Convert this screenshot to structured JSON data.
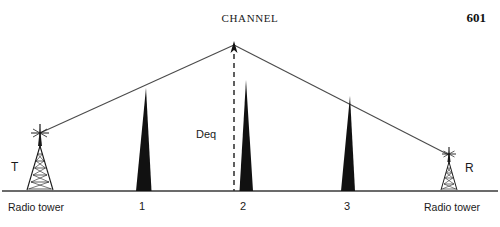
{
  "header": {
    "title": "CHANNEL",
    "page_number": "601"
  },
  "figure": {
    "baseline_label": "ground-line",
    "towers": [
      {
        "id": "transmit",
        "letter": "T",
        "caption": "Radio tower",
        "side": "left"
      },
      {
        "id": "receive",
        "letter": "R",
        "caption": "Radio tower",
        "side": "right"
      }
    ],
    "peaks": [
      {
        "id": "peak-1",
        "label": "1"
      },
      {
        "id": "peak-2",
        "label": "2"
      },
      {
        "id": "peak-3",
        "label": "3"
      }
    ],
    "annotations": [
      {
        "id": "deq",
        "label": "Deq"
      }
    ],
    "colors": {
      "peak_fill": "#111111",
      "line": "#3a3a3a",
      "text": "#1a1a1a",
      "background": "#ffffff"
    }
  }
}
